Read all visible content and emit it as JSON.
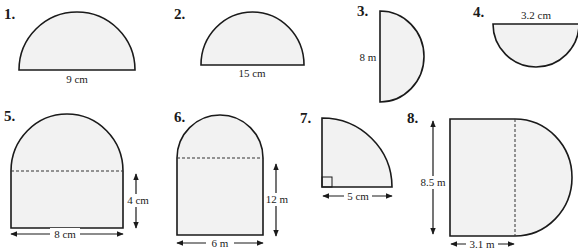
{
  "figures": [
    {
      "number": "1.",
      "shape": "semicircle",
      "dimension_label": "9 cm",
      "measure": "diameter"
    },
    {
      "number": "2.",
      "shape": "semicircle",
      "dimension_label": "15 cm",
      "measure": "diameter"
    },
    {
      "number": "3.",
      "shape": "semicircle",
      "dimension_label": "8 m",
      "measure": "diameter"
    },
    {
      "number": "4.",
      "shape": "semicircle",
      "dimension_label": "3.2 cm",
      "measure": "diameter"
    },
    {
      "number": "5.",
      "shape": "rectangle-with-semicircle",
      "dimension_labels": [
        "4 cm",
        "8 cm"
      ]
    },
    {
      "number": "6.",
      "shape": "rectangle-with-semicircle",
      "dimension_labels": [
        "12 m",
        "6 m"
      ]
    },
    {
      "number": "7.",
      "shape": "quarter-circle",
      "dimension_label": "5 cm",
      "measure": "radius"
    },
    {
      "number": "8.",
      "shape": "rectangle-with-semicircle",
      "dimension_labels": [
        "8.5 m",
        "3.1 m"
      ]
    }
  ],
  "colors": {
    "fill": "#f2f2f2",
    "stroke": "#1a1a1a"
  }
}
